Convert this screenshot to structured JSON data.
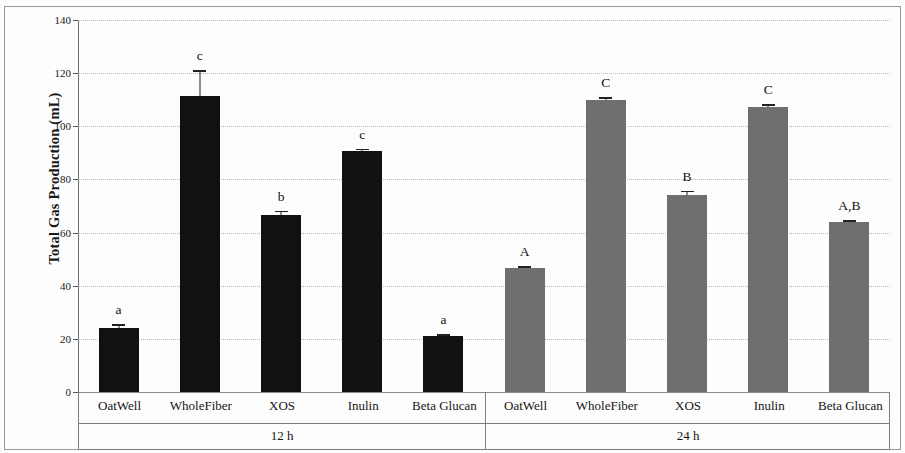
{
  "chart_data": {
    "type": "bar",
    "title": "",
    "xlabel": "",
    "ylabel": "Total Gas Production (mL)",
    "ylim": [
      0,
      140
    ],
    "yticks": [
      0,
      20,
      40,
      60,
      80,
      100,
      120,
      140
    ],
    "ytick_labels": [
      "0",
      "20",
      "40",
      "60",
      "80",
      "100",
      "120",
      "140"
    ],
    "grid": true,
    "legend": "none",
    "categories": [
      "OatWell",
      "WholeFiber",
      "XOS",
      "Inulin",
      "Beta Glucan"
    ],
    "group_labels": [
      "12 h",
      "24 h"
    ],
    "series": [
      {
        "name": "12 h",
        "color": "#111111",
        "values": [
          24.0,
          111.5,
          66.8,
          90.8,
          21.0
        ],
        "errors": [
          1.5,
          9.5,
          1.5,
          0.8,
          0.8
        ],
        "sig_letters": [
          "a",
          "c",
          "b",
          "c",
          "a"
        ]
      },
      {
        "name": "24 h",
        "color": "#6f6f6f",
        "values": [
          46.5,
          109.8,
          74.2,
          107.3,
          63.8
        ],
        "errors": [
          0.8,
          1.2,
          1.5,
          1.0,
          0.8
        ],
        "sig_letters": [
          "A",
          "C",
          "B",
          "C",
          "A,B"
        ]
      }
    ]
  },
  "axis": {
    "y_title": "Total Gas Production (mL)"
  }
}
